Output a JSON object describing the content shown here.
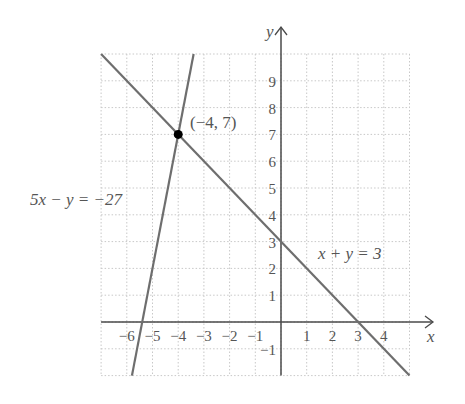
{
  "chart_data": {
    "type": "line",
    "title": "",
    "xlabel": "x",
    "ylabel": "y",
    "xlim": [
      -7,
      5
    ],
    "ylim": [
      -2,
      10
    ],
    "grid": true,
    "grid_style": "dotted",
    "x_ticks": [
      -6,
      -5,
      -4,
      -3,
      -2,
      -1,
      1,
      2,
      3,
      4
    ],
    "y_ticks": [
      -1,
      1,
      2,
      3,
      4,
      5,
      6,
      7,
      8,
      9
    ],
    "series": [
      {
        "name": "5x − y = −27",
        "equation": "y = 5x + 27",
        "x": [
          -5.8,
          -4.6
        ],
        "y": [
          -2,
          4
        ],
        "label_position": "left"
      },
      {
        "name": "x + y = 3",
        "equation": "y = 3 − x",
        "x": [
          -7,
          5
        ],
        "y": [
          10,
          -2
        ],
        "label_position": "right"
      }
    ],
    "points": [
      {
        "x": -4,
        "y": 7,
        "label": "(−4, 7)"
      }
    ],
    "annotations": [
      "5x − y = −27",
      "x + y = 3",
      "(−4, 7)"
    ]
  },
  "labels": {
    "x_axis": "x",
    "y_axis": "y",
    "line1": "5x − y = −27",
    "line2": "x + y = 3",
    "point": "(−4, 7)"
  },
  "colors": {
    "line": "#6e6e6e",
    "axis": "#4a4a4a",
    "grid": "#c8c8c8",
    "point": "#000000",
    "text": "#555555"
  }
}
